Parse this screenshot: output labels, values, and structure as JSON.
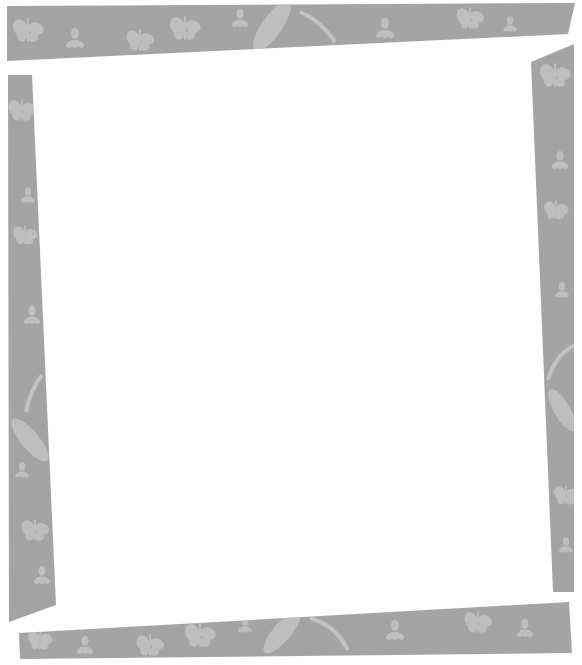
{
  "canvas": {
    "width": 582,
    "height": 665,
    "background": "#ffffff"
  },
  "frame": {
    "strip_color": "#a4a4a4",
    "motif_color": "#c6c6c6",
    "motif_theme": "butterflies-and-leaves",
    "strips": [
      {
        "name": "top-strip",
        "points": "7,6 575,3 568,34 7,61"
      },
      {
        "name": "left-strip",
        "points": "8,75 32,75 56,605 9,622"
      },
      {
        "name": "right-strip",
        "points": "531,62 574,44 574,592 553,592"
      },
      {
        "name": "bottom-strip",
        "points": "19,633 569,602 572,653 20,659"
      }
    ]
  },
  "content": {
    "text": ""
  }
}
